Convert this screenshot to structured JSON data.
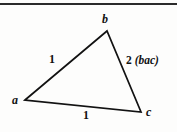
{
  "figure": {
    "background_color": "#fdfdfc",
    "ink_color": "#111111",
    "rule": {
      "present": true,
      "color": "#2b2b2b"
    },
    "shape": {
      "type": "triangle",
      "stroke_color": "#121212",
      "stroke_width": 1.6,
      "fill": "none",
      "vertices": [
        {
          "id": "a",
          "label": "a",
          "x": 25,
          "y": 100
        },
        {
          "id": "b",
          "label": "b",
          "x": 107,
          "y": 31
        },
        {
          "id": "c",
          "label": "c",
          "x": 141,
          "y": 112
        }
      ]
    },
    "labels": {
      "vertex_a": "a",
      "vertex_b": "b",
      "vertex_c": "c",
      "side_ab": "1",
      "side_ac": "1",
      "side_bc_value": "2",
      "side_bc_term": "(bac)"
    }
  }
}
